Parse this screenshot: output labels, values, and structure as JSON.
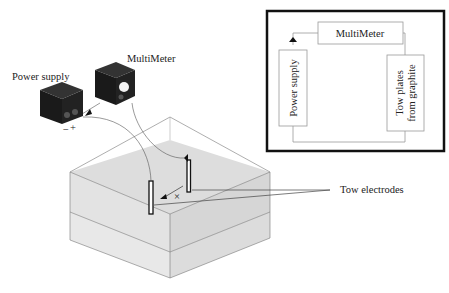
{
  "labels": {
    "power_supply": "Power supply",
    "multimeter": "MultiMeter",
    "tow_electrodes": "Tow electrodes",
    "plus": "+",
    "minus": "−",
    "x_mark": "×"
  },
  "schematic": {
    "multimeter": "MultiMeter",
    "power_supply": "Power supply",
    "tow_plates_line1": "Tow plates",
    "tow_plates_line2": "from graphite"
  }
}
